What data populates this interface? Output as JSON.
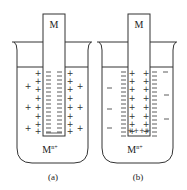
{
  "diagram": {
    "stroke_color": "#333333",
    "panels": [
      {
        "id": "a",
        "caption": "(a)",
        "electrode_label": "M",
        "solution_label": "M",
        "solution_superscript": "n+",
        "electrode_charge": "−",
        "solution_inner_charge": "+",
        "solution_outer_charge": "+"
      },
      {
        "id": "b",
        "caption": "(b)",
        "electrode_label": "M",
        "solution_label": "M",
        "solution_superscript": "n+",
        "electrode_charge": "+",
        "electrode_bottom_charge": "++++",
        "solution_inner_charge": "−",
        "solution_outer_charge": "−"
      }
    ]
  }
}
